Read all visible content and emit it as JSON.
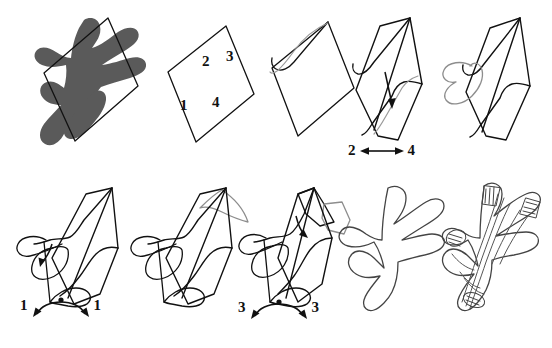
{
  "figure": {
    "background_color": "#ffffff",
    "ink_color": "#111111",
    "fill_color": "#5a5a5a",
    "faint_color": "#8d8d8d",
    "width": 552,
    "height": 348
  },
  "panels": [
    {
      "id": "panel-1",
      "name": "filled-silhouette-with-parallelogram",
      "row": 1,
      "index": 1,
      "description": "Dark grey filled blastoderm silhouette overlaid by an outlined parallelogram",
      "has_fill": true,
      "has_parallelogram": true
    },
    {
      "id": "panel-2",
      "name": "blank-parallelogram-with-quadrant-numbers",
      "row": 1,
      "index": 2,
      "description": "Empty parallelogram labelled with quadrant numbers",
      "has_fill": false,
      "has_parallelogram": true,
      "quadrant_labels": [
        {
          "text": "2",
          "position": "top-left"
        },
        {
          "text": "3",
          "position": "top-right"
        },
        {
          "text": "1",
          "position": "bottom-left"
        },
        {
          "text": "4",
          "position": "bottom-right"
        }
      ]
    },
    {
      "id": "panel-3",
      "name": "parallelogram-first-fold",
      "row": 1,
      "index": 3,
      "description": "Parallelogram with a first notch folded in at the upper-left edge",
      "has_fill": false,
      "has_parallelogram": true
    },
    {
      "id": "panel-4",
      "name": "parallelogram-fold-with-down-arrow",
      "row": 1,
      "index": 4,
      "description": "Folded sheet with a straight downward arrow indicating fold direction",
      "has_fill": false,
      "has_parallelogram": true,
      "annotation": {
        "type": "straight-arrow",
        "direction": "down"
      },
      "caption": {
        "left": "2",
        "right": "4",
        "arrow": "double-headed-horizontal"
      }
    },
    {
      "id": "panel-5",
      "name": "parallelogram-with-loop",
      "row": 1,
      "index": 5,
      "description": "Folded sheet with a looping outgrowth emerging at the left margin",
      "has_fill": false,
      "has_parallelogram": true
    },
    {
      "id": "panel-6",
      "name": "loop-extended-with-rotation-arrow",
      "row": 2,
      "index": 6,
      "description": "Extended loop with a small curved rotation arrow inside the sheet",
      "has_fill": false,
      "has_parallelogram": true,
      "annotation": {
        "type": "curved-arrow",
        "direction": "down-left"
      },
      "caption": {
        "left": "1",
        "right": "1",
        "arrow": "curved-double-headed"
      }
    },
    {
      "id": "panel-7",
      "name": "loop-with-faint-overlay",
      "row": 2,
      "index": 7,
      "description": "Same stage with a faint grey ghost outline of the next fold overlaid at the upper right",
      "has_fill": false,
      "has_parallelogram": true,
      "has_ghost_overlay": true
    },
    {
      "id": "panel-8",
      "name": "loop-with-limb-buds-and-rotation-arrow",
      "row": 2,
      "index": 8,
      "description": "Folding sheet with two limb-bud projections and a short curved arrow",
      "has_fill": false,
      "has_parallelogram": true,
      "has_ghost_overlay": true,
      "annotation": {
        "type": "curved-arrow",
        "direction": "down-right"
      },
      "caption": {
        "left": "3",
        "right": "3",
        "arrow": "curved-double-headed"
      }
    },
    {
      "id": "panel-9",
      "name": "outline-only-embryo",
      "row": 2,
      "index": 9,
      "description": "Pure outline of the folded embryo, parallelogram removed",
      "has_fill": false,
      "has_parallelogram": false
    },
    {
      "id": "panel-10",
      "name": "final-embryo-with-internal-detail",
      "row": 2,
      "index": 10,
      "description": "Final embryo outline with internal striations, digit hatching and somite detail",
      "has_fill": false,
      "has_parallelogram": false,
      "has_internal_detail": true
    }
  ],
  "annotations": {
    "panel4_caption_left": "2",
    "panel4_caption_right": "4",
    "panel6_caption_left": "1",
    "panel6_caption_right": "1",
    "panel8_caption_left": "3",
    "panel8_caption_right": "3",
    "quadrant_top_left": "2",
    "quadrant_top_right": "3",
    "quadrant_bottom_left": "1",
    "quadrant_bottom_right": "4"
  }
}
